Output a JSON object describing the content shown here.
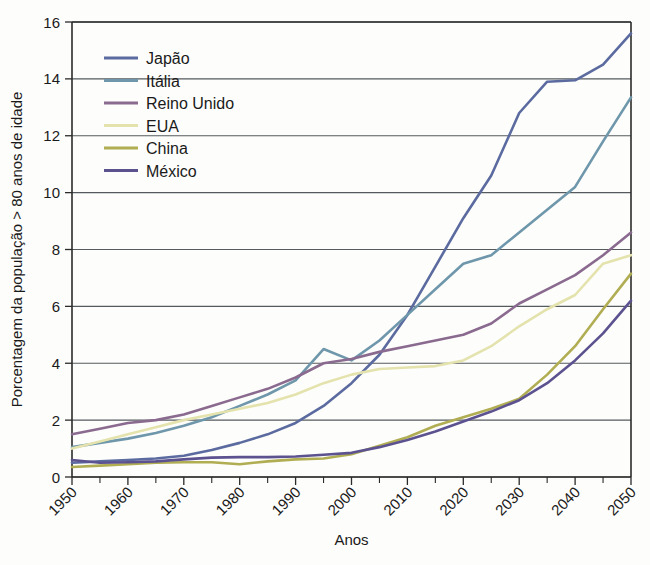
{
  "chart_data": {
    "type": "line",
    "title": "",
    "xlabel": "Anos",
    "ylabel": "Porcentagem da população > 80 anos de idade",
    "xlim": [
      1950,
      2050
    ],
    "ylim": [
      0,
      16
    ],
    "ytick_step": 2,
    "xtick_step": 10,
    "x_minor_step": 5,
    "grid": "horizontal",
    "legend_position": "top-left",
    "ytick_labels": [
      "0",
      "2",
      "4",
      "6",
      "8",
      "10",
      "12",
      "14",
      "16"
    ],
    "xtick_labels": [
      "1950",
      "1960",
      "1970",
      "1980",
      "1990",
      "2000",
      "2010",
      "2020",
      "2030",
      "2040",
      "2050"
    ],
    "x": [
      1950,
      1955,
      1960,
      1965,
      1970,
      1975,
      1980,
      1985,
      1990,
      1995,
      2000,
      2005,
      2010,
      2015,
      2020,
      2025,
      2030,
      2035,
      2040,
      2045,
      2050
    ],
    "series": [
      {
        "name": "Japão",
        "color": "#5b6ba0",
        "values": [
          0.5,
          0.55,
          0.6,
          0.65,
          0.75,
          0.95,
          1.2,
          1.5,
          1.9,
          2.5,
          3.3,
          4.3,
          5.7,
          7.4,
          9.1,
          10.6,
          12.8,
          13.9,
          13.95,
          14.5,
          15.6
        ]
      },
      {
        "name": "Itália",
        "color": "#6f97ab",
        "values": [
          1.05,
          1.2,
          1.35,
          1.55,
          1.8,
          2.1,
          2.5,
          2.9,
          3.4,
          4.5,
          4.1,
          4.8,
          5.7,
          6.6,
          7.5,
          7.8,
          8.6,
          9.4,
          10.2,
          11.8,
          13.35
        ]
      },
      {
        "name": "Reino Unido",
        "color": "#8a6a8f",
        "values": [
          1.5,
          1.7,
          1.9,
          2.0,
          2.2,
          2.5,
          2.8,
          3.1,
          3.5,
          4.0,
          4.15,
          4.4,
          4.6,
          4.8,
          5.0,
          5.4,
          6.1,
          6.6,
          7.1,
          7.8,
          8.6
        ]
      },
      {
        "name": "EUA",
        "color": "#e4e3ad",
        "values": [
          1.0,
          1.25,
          1.5,
          1.75,
          2.0,
          2.2,
          2.4,
          2.6,
          2.9,
          3.3,
          3.6,
          3.8,
          3.85,
          3.9,
          4.1,
          4.6,
          5.3,
          5.9,
          6.4,
          7.5,
          7.8
        ]
      },
      {
        "name": "China",
        "color": "#b0ad52",
        "values": [
          0.35,
          0.4,
          0.45,
          0.5,
          0.52,
          0.52,
          0.45,
          0.55,
          0.62,
          0.65,
          0.8,
          1.1,
          1.4,
          1.8,
          2.1,
          2.4,
          2.75,
          3.6,
          4.6,
          5.9,
          7.15
        ]
      },
      {
        "name": "México",
        "color": "#5c5290",
        "values": [
          0.6,
          0.5,
          0.52,
          0.55,
          0.62,
          0.68,
          0.7,
          0.7,
          0.72,
          0.78,
          0.85,
          1.05,
          1.3,
          1.6,
          1.95,
          2.3,
          2.7,
          3.3,
          4.1,
          5.05,
          6.2
        ]
      }
    ]
  },
  "legend": {
    "items": [
      {
        "label": "Japão"
      },
      {
        "label": "Itália"
      },
      {
        "label": "Reino Unido"
      },
      {
        "label": "EUA"
      },
      {
        "label": "China"
      },
      {
        "label": "México"
      }
    ]
  }
}
